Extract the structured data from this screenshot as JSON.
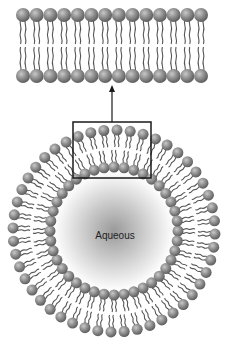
{
  "diagram": {
    "core_label": "Aqueous",
    "colors": {
      "background": "#ffffff",
      "head_fill": "#8c8c8c",
      "head_highlight": "#c8c8c8",
      "head_shadow": "#5e5e5e",
      "tail": "#555555",
      "box": "#1a1a1a",
      "arrow": "#1a1a1a",
      "core_center": "#9a9a9a",
      "core_edge": "#ffffff"
    },
    "bilayer": {
      "head_count": 14,
      "x_start": 23,
      "x_end": 201,
      "top_row_y": 15,
      "bottom_row_y": 76,
      "head_radius": 7
    },
    "liposome": {
      "center_x": 114,
      "center_y": 231,
      "outer_head_count": 48,
      "outer_radius": 101,
      "inner_head_count": 40,
      "inner_radius": 64,
      "head_radius": 5.5,
      "core_radius": 60
    },
    "zoom_box": {
      "x": 73,
      "y": 122,
      "width": 78,
      "height": 56
    },
    "arrow": {
      "x": 112,
      "y_from": 122,
      "y_to": 85
    },
    "label_position": {
      "x": 115,
      "y": 235
    }
  }
}
